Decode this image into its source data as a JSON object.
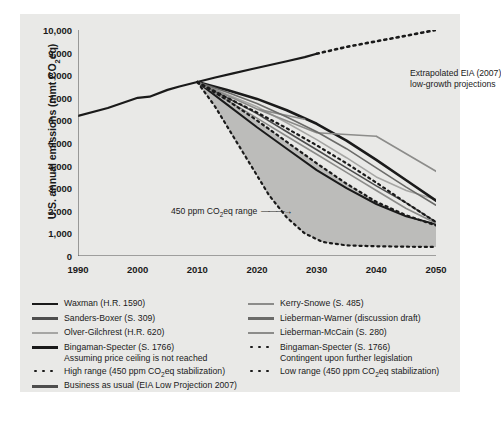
{
  "chart_data": {
    "type": "line",
    "title": "",
    "xlabel": "",
    "ylabel": "U.S. annual emissions (mmt CO2eq)",
    "ylabel_parts": {
      "pre": "U.S. annual emissions (mmt CO",
      "sub": "2",
      "post": "eq)"
    },
    "xlim": [
      1990,
      2050
    ],
    "ylim": [
      0,
      10000
    ],
    "grid": false,
    "xticks": [
      1990,
      2000,
      2010,
      2020,
      2030,
      2040,
      2050
    ],
    "xtick_labels": [
      "1990",
      "2000",
      "2010",
      "2020",
      "2030",
      "2040",
      "2050"
    ],
    "yticks": [
      0,
      1000,
      2000,
      3000,
      4000,
      5000,
      6000,
      7000,
      8000,
      9000,
      10000
    ],
    "ytick_labels": [
      "0",
      "1,000",
      "2,000",
      "3,000",
      "4,000",
      "5,000",
      "6,000",
      "7,000",
      "8,000",
      "9,000",
      "10,000"
    ],
    "legend_position": "below-plot-two-columns",
    "annotations": [
      {
        "name": "eia-extrapolation",
        "text_line1": "Extrapolated EIA (2007)",
        "text_line2": "low-growth projections",
        "x": 2038,
        "y": 8700
      },
      {
        "name": "range-callout",
        "text_pre": "450 ppm CO",
        "text_sub": "2",
        "text_post": "eq range",
        "x": 2006,
        "y": 3300,
        "has_arrow": true
      }
    ],
    "shaded_band": {
      "name": "450-ppm-co2eq-range",
      "fill": "#b9b9b7",
      "upper_series": "High range (450 ppm CO2eq stabilization)",
      "lower_series": "Low range (450 ppm CO2eq stabilization)"
    },
    "series": [
      {
        "name": "Business as usual (EIA Low Projection 2007)",
        "color": "#1a1a1a",
        "style": "solid-then-dotted",
        "width": 2.2,
        "x": [
          1990,
          1995,
          2000,
          2002,
          2005,
          2007,
          2010,
          2013,
          2016,
          2019,
          2022,
          2025,
          2028,
          2030,
          2035,
          2040,
          2045,
          2050
        ],
        "values": [
          6200,
          6550,
          7000,
          7050,
          7350,
          7500,
          7700,
          7900,
          8080,
          8260,
          8440,
          8620,
          8800,
          8950,
          9250,
          9500,
          9750,
          10000
        ],
        "dotted_from": 2030
      },
      {
        "name": "Waxman (H.R. 1590)",
        "color": "#1a1a1a",
        "style": "solid",
        "width": 2.0,
        "x": [
          2010,
          2015,
          2020,
          2025,
          2030,
          2035,
          2040,
          2045,
          2050
        ],
        "values": [
          7700,
          6700,
          5700,
          4750,
          3800,
          3000,
          2300,
          1750,
          1400
        ]
      },
      {
        "name": "Sanders-Boxer (S. 309)",
        "color": "#4d4d4d",
        "style": "solid",
        "width": 1.6,
        "x": [
          2010,
          2015,
          2020,
          2025,
          2030,
          2035,
          2040,
          2045,
          2050
        ],
        "values": [
          7700,
          7000,
          6300,
          5500,
          4700,
          3900,
          3100,
          2350,
          1500
        ]
      },
      {
        "name": "Olver-Gilchrest (H.R. 620)",
        "color": "#a6a6a4",
        "style": "solid",
        "width": 1.6,
        "x": [
          2010,
          2015,
          2020,
          2025,
          2030,
          2035,
          2040,
          2045,
          2050
        ],
        "values": [
          7700,
          7150,
          6600,
          5900,
          5150,
          4350,
          3500,
          2900,
          2500
        ]
      },
      {
        "name": "Bingaman-Specter (S. 1766) Assuming price ceiling is not reached",
        "label_line1": "Bingaman-Specter (S. 1766)",
        "label_line2": "Assuming price ceiling is not reached",
        "color": "#1a1a1a",
        "style": "solid",
        "width": 2.6,
        "x": [
          2010,
          2015,
          2020,
          2025,
          2030,
          2035,
          2040,
          2045,
          2050
        ],
        "values": [
          7700,
          7350,
          6950,
          6450,
          5850,
          5100,
          4250,
          3350,
          2450
        ]
      },
      {
        "name": "Kerry-Snowe (S. 485)",
        "color": "#8c8c8a",
        "style": "solid-zigzag",
        "width": 1.6,
        "x": [
          2010,
          2020,
          2028,
          2020,
          2030,
          2040,
          2050,
          2040
        ],
        "values": [
          7700,
          6500,
          6050,
          6500,
          5450,
          5300,
          3750,
          5300
        ]
      },
      {
        "name": "Lieberman-Warner (discussion draft)",
        "color": "#6b6b69",
        "style": "solid",
        "width": 1.6,
        "x": [
          2010,
          2015,
          2020,
          2025,
          2030,
          2035,
          2040,
          2045,
          2050
        ],
        "values": [
          7700,
          7250,
          6750,
          6150,
          5500,
          4750,
          3900,
          3050,
          2250
        ]
      },
      {
        "name": "Lieberman-McCain (S. 280)",
        "color": "#8c8c8a",
        "style": "solid",
        "width": 1.6,
        "x": [
          2010,
          2015,
          2020,
          2025,
          2030,
          2035,
          2040,
          2045,
          2050
        ],
        "values": [
          7700,
          6900,
          6100,
          5300,
          4500,
          3700,
          2900,
          2100,
          1450
        ]
      },
      {
        "name": "Bingaman-Specter (S. 1766) Contingent upon further legislation",
        "label_line1": "Bingaman-Specter (S. 1766)",
        "label_line2": "Contingent upon further legislation",
        "color": "#1a1a1a",
        "style": "dotted",
        "width": 2.2,
        "x": [
          2010,
          2015,
          2020,
          2025,
          2030,
          2035,
          2040,
          2045,
          2050
        ],
        "values": [
          7700,
          7000,
          6350,
          5650,
          4900,
          4100,
          3250,
          2350,
          1500
        ]
      },
      {
        "name": "High range (450 ppm CO2eq stabilization)",
        "label_pre": "High range (450 ppm CO",
        "label_sub": "2",
        "label_post": "eq stabilization)",
        "color": "#1a1a1a",
        "style": "dotted",
        "width": 2.2,
        "x": [
          2010,
          2015,
          2020,
          2025,
          2030,
          2035,
          2040,
          2045,
          2050
        ],
        "values": [
          7700,
          6900,
          6000,
          5050,
          4100,
          3200,
          2400,
          1800,
          1350
        ]
      },
      {
        "name": "Low range (450 ppm CO2eq stabilization)",
        "label_pre": "Low range (450 ppm CO",
        "label_sub": "2",
        "label_post": "eq stabilization)",
        "color": "#1a1a1a",
        "style": "dotted",
        "width": 2.2,
        "x": [
          2010,
          2013,
          2016,
          2019,
          2022,
          2025,
          2028,
          2031,
          2035,
          2040,
          2045,
          2050
        ],
        "values": [
          7700,
          6600,
          5300,
          4000,
          2700,
          1700,
          1000,
          620,
          470,
          430,
          410,
          400
        ]
      }
    ]
  },
  "legend": {
    "left": [
      {
        "key": "waxman",
        "swatch": "line",
        "color": "#1a1a1a",
        "thick": 2.6,
        "label": "Waxman (H.R. 1590)"
      },
      {
        "key": "sanders-boxer",
        "swatch": "line",
        "color": "#4d4d4d",
        "thick": 2.2,
        "label": "Sanders-Boxer (S. 309)"
      },
      {
        "key": "olver-gilchrest",
        "swatch": "line",
        "color": "#a6a6a4",
        "thick": 2.0,
        "label": "Olver-Gilchrest (H.R. 620)"
      },
      {
        "key": "bingaman-specter-price-ceiling",
        "swatch": "line",
        "color": "#1a1a1a",
        "thick": 3.4,
        "label": "Bingaman-Specter (S. 1766)",
        "sublabel": "Assuming price ceiling is not reached"
      },
      {
        "key": "high-range",
        "swatch": "dots",
        "color": "#1a1a1a",
        "label_pre": "High range (450 ppm CO",
        "label_sub": "2",
        "label_post": "eq stabilization)"
      },
      {
        "key": "business-as-usual",
        "swatch": "line",
        "color": "#4d4d4d",
        "thick": 2.4,
        "label": "Business as usual (EIA Low Projection 2007)"
      }
    ],
    "right": [
      {
        "key": "kerry-snowe",
        "swatch": "line",
        "color": "#8c8c8a",
        "thick": 2.2,
        "label": "Kerry-Snowe (S. 485)"
      },
      {
        "key": "lieberman-warner",
        "swatch": "line",
        "color": "#6b6b69",
        "thick": 2.6,
        "label": "Lieberman-Warner (discussion draft)"
      },
      {
        "key": "lieberman-mccain",
        "swatch": "line",
        "color": "#8c8c8a",
        "thick": 2.2,
        "label": "Lieberman-McCain (S. 280)"
      },
      {
        "key": "bingaman-specter-contingent",
        "swatch": "dots",
        "color": "#1a1a1a",
        "label": "Bingaman-Specter (S. 1766)",
        "sublabel": "Contingent upon further legislation"
      },
      {
        "key": "low-range",
        "swatch": "dots",
        "color": "#1a1a1a",
        "label_pre": "Low range (450 ppm CO",
        "label_sub": "2",
        "label_post": "eq stabilization)"
      }
    ]
  }
}
